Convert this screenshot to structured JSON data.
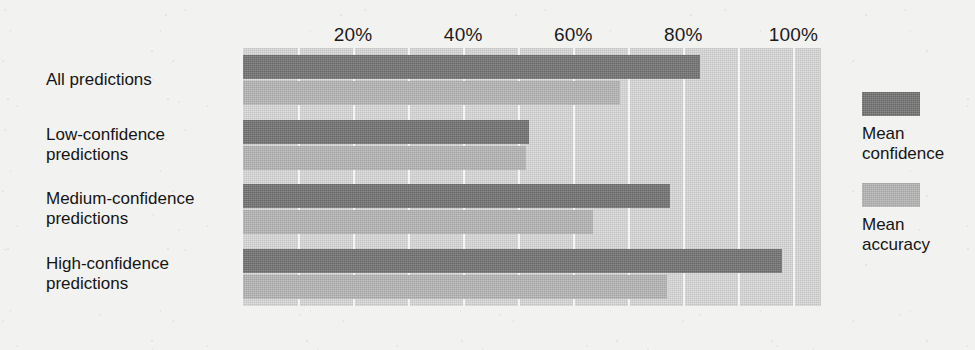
{
  "chart_data": {
    "type": "bar",
    "orientation": "horizontal",
    "title": "",
    "xlabel": "",
    "ylabel": "",
    "xlim": [
      0,
      105
    ],
    "grid": true,
    "grid_axis": "x",
    "legend_position": "right",
    "categories": [
      "All predictions",
      "Low-confidence\npredictions",
      "Medium-confidence\npredictions",
      "High-confidence\npredictions"
    ],
    "tick_labels": [
      "20%",
      "40%",
      "60%",
      "80%",
      "100%"
    ],
    "tick_values": [
      20,
      40,
      60,
      80,
      100
    ],
    "series": [
      {
        "name": "Mean\nconfidence",
        "legend_label": "Mean\nconfidence",
        "color": "#717171",
        "values": [
          83,
          52,
          77.5,
          98
        ]
      },
      {
        "name": "Mean\naccuracy",
        "legend_label": "Mean\naccuracy",
        "color": "#b4b4b4",
        "values": [
          68.5,
          51.5,
          63.5,
          77
        ]
      }
    ]
  },
  "colors": {
    "page_background": "#f2f2f0",
    "plot_background": "#d2d2d2",
    "gridline": "#f4f4f4",
    "mean_confidence": "#717171",
    "mean_accuracy": "#b4b4b4",
    "text": "#151515"
  }
}
